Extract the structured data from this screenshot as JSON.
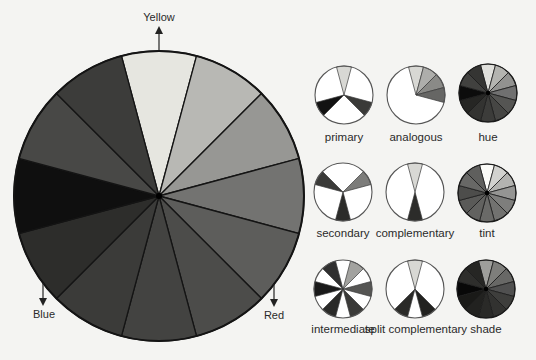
{
  "main_wheel": {
    "segments": [
      {
        "index": 0,
        "color": "#e6e6e0"
      },
      {
        "index": 1,
        "color": "#b8b8b4"
      },
      {
        "index": 2,
        "color": "#979794"
      },
      {
        "index": 3,
        "color": "#737371"
      },
      {
        "index": 4,
        "color": "#5d5d5b"
      },
      {
        "index": 5,
        "color": "#4c4c4a"
      },
      {
        "index": 6,
        "color": "#434341"
      },
      {
        "index": 7,
        "color": "#3b3b39"
      },
      {
        "index": 8,
        "color": "#2d2d2b"
      },
      {
        "index": 9,
        "color": "#0f0f0f"
      },
      {
        "index": 10,
        "color": "#484846"
      },
      {
        "index": 11,
        "color": "#3c3c3a"
      }
    ],
    "labels": {
      "yellow": "Yellow",
      "red": "Red",
      "blue": "Blue"
    }
  },
  "small_wheels": [
    {
      "name": "primary",
      "label": "primary",
      "mode": "select",
      "slices": [
        0,
        4,
        8
      ],
      "colors": {
        "0": "#d8d8d4",
        "4": "#3a3a38",
        "8": "#121212"
      }
    },
    {
      "name": "analogous",
      "label": "analogous",
      "mode": "select",
      "slices": [
        0,
        1,
        2,
        3
      ],
      "colors": {
        "0": "#d8d8d4",
        "1": "#aeaeab",
        "2": "#8a8a87",
        "3": "#666664"
      }
    },
    {
      "name": "hue",
      "label": "hue",
      "mode": "all",
      "slices": [
        0,
        1,
        2,
        3,
        4,
        5,
        6,
        7,
        8,
        9,
        10,
        11
      ],
      "colors": {
        "0": "#e0e0dc",
        "1": "#b4b4b0",
        "2": "#929290",
        "3": "#707070",
        "4": "#555553",
        "5": "#464644",
        "6": "#3c3c3a",
        "7": "#333331",
        "8": "#262624",
        "9": "#0c0c0c",
        "10": "#41413f",
        "11": "#353533"
      }
    },
    {
      "name": "secondary",
      "label": "secondary",
      "mode": "select",
      "slices": [
        2,
        6,
        10
      ],
      "colors": {
        "2": "#7c7c7a",
        "6": "#2c2c2a",
        "10": "#3a3a38"
      }
    },
    {
      "name": "complementary",
      "label": "complementary",
      "mode": "select",
      "slices": [
        0,
        6
      ],
      "colors": {
        "0": "#d8d8d4",
        "6": "#2c2c2a"
      }
    },
    {
      "name": "tint",
      "label": "tint",
      "mode": "all",
      "slices": [
        0,
        1,
        2,
        3,
        4,
        5,
        6,
        7,
        8,
        9,
        10,
        11
      ],
      "colors": {
        "0": "#fbfbf8",
        "1": "#d2d2cf",
        "2": "#b3b3b0",
        "3": "#959593",
        "4": "#7e7e7c",
        "5": "#727270",
        "6": "#6a6a68",
        "7": "#626260",
        "8": "#5a5a58",
        "9": "#4d4d4b",
        "10": "#686866",
        "11": "#5f5f5d"
      }
    },
    {
      "name": "intermediate",
      "label": "intermediate",
      "mode": "select",
      "slices": [
        1,
        3,
        5,
        7,
        9,
        11
      ],
      "colors": {
        "1": "#a2a29f",
        "3": "#555553",
        "5": "#3a3a38",
        "7": "#2a2a28",
        "9": "#1a1a1a",
        "11": "#303030"
      }
    },
    {
      "name": "split-complementary",
      "label": "split complementary",
      "mode": "select",
      "slices": [
        0,
        5,
        7
      ],
      "colors": {
        "0": "#d8d8d4",
        "5": "#222220",
        "7": "#2a2a28"
      }
    },
    {
      "name": "shade",
      "label": "shade",
      "mode": "all",
      "slices": [
        0,
        1,
        2,
        3,
        4,
        5,
        6,
        7,
        8,
        9,
        10,
        11
      ],
      "colors": {
        "0": "#9e9e9b",
        "1": "#7e7e7b",
        "2": "#686866",
        "3": "#505050",
        "4": "#3e3e3c",
        "5": "#323230",
        "6": "#2a2a28",
        "7": "#222220",
        "8": "#1a1a18",
        "9": "#080808",
        "10": "#2e2e2c",
        "11": "#262624"
      }
    }
  ]
}
